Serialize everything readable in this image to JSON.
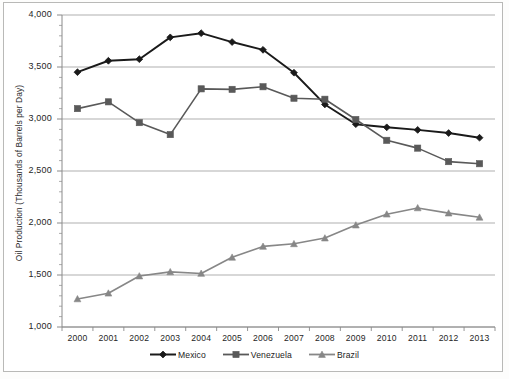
{
  "chart_data": {
    "type": "line",
    "title": "",
    "xlabel": "",
    "ylabel": "Oil Production (Thousands of Barrels per Day)",
    "categories": [
      "2000",
      "2001",
      "2002",
      "2003",
      "2004",
      "2005",
      "2006",
      "2007",
      "2008",
      "2009",
      "2010",
      "2011",
      "2012",
      "2013"
    ],
    "x": [
      2000,
      2001,
      2002,
      2003,
      2004,
      2005,
      2006,
      2007,
      2008,
      2009,
      2010,
      2011,
      2012,
      2013
    ],
    "ylim": [
      1000,
      4000
    ],
    "yticks": [
      1000,
      1500,
      2000,
      2500,
      3000,
      3500,
      4000
    ],
    "ytick_labels": [
      "1,000",
      "1,500",
      "2,000",
      "2,500",
      "3,000",
      "3,500",
      "4,000"
    ],
    "grid": true,
    "legend_position": "bottom",
    "series": [
      {
        "name": "Mexico",
        "color": "#1a1a1a",
        "marker": "diamond",
        "values": [
          3450,
          3560,
          3575,
          3785,
          3825,
          3740,
          3665,
          3445,
          3140,
          2950,
          2920,
          2895,
          2865,
          2820
        ]
      },
      {
        "name": "Venezuela",
        "color": "#595959",
        "marker": "square",
        "values": [
          3100,
          3165,
          2965,
          2850,
          3290,
          3285,
          3310,
          3200,
          3190,
          2995,
          2795,
          2720,
          2590,
          2570
        ]
      },
      {
        "name": "Brazil",
        "color": "#878787",
        "marker": "triangle",
        "values": [
          1270,
          1325,
          1490,
          1530,
          1515,
          1670,
          1775,
          1800,
          1855,
          1980,
          2085,
          2145,
          2095,
          2055
        ]
      }
    ]
  },
  "axis": {
    "y_title": "Oil Production (Thousands of Barrels per Day)"
  },
  "legend": {
    "items": [
      {
        "label": "Mexico"
      },
      {
        "label": "Venezuela"
      },
      {
        "label": "Brazil"
      }
    ]
  }
}
